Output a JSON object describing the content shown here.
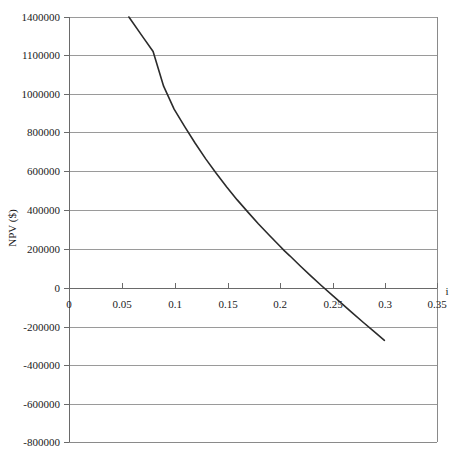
{
  "chart_data": {
    "type": "line",
    "title": "",
    "subtitle": "",
    "xlabel": "i",
    "ylabel": "NPV ($)",
    "grid": true,
    "legend": false,
    "legend_position": "none",
    "xlim": [
      0,
      0.35
    ],
    "ylim": [
      -800000,
      1400000
    ],
    "x_tick_labels": [
      "0",
      "0.05",
      "0.1",
      "0.15",
      "0.2",
      "0.25",
      "0.3",
      "0.35"
    ],
    "x_tick_values": [
      0,
      0.05,
      0.1,
      0.15,
      0.2,
      0.25,
      0.3,
      0.35
    ],
    "y_tick_labels": [
      "1400000",
      "1100000",
      "1000000",
      "800000",
      "600000",
      "400000",
      "200000",
      "0",
      "-200000",
      "-400000",
      "-600000",
      "-800000"
    ],
    "y_tick_values": [
      1400000,
      1100000,
      1000000,
      800000,
      600000,
      400000,
      200000,
      0,
      -200000,
      -400000,
      -600000,
      -800000
    ],
    "series": [
      {
        "name": "NPV",
        "x": [
          0.057,
          0.07,
          0.08,
          0.09,
          0.1,
          0.11,
          0.12,
          0.13,
          0.14,
          0.15,
          0.16,
          0.17,
          0.18,
          0.19,
          0.2,
          0.205,
          0.21,
          0.22,
          0.23,
          0.24,
          0.25,
          0.26,
          0.27,
          0.28,
          0.29,
          0.3
        ],
        "y": [
          1400000,
          1245000,
          1128000,
          1020000,
          920000,
          828000,
          742000,
          662000,
          588000,
          518000,
          452000,
          390000,
          330000,
          273000,
          218000,
          190000,
          165000,
          113000,
          62000,
          13000,
          -35000,
          -83000,
          -130000,
          -177000,
          -223000,
          -270000
        ],
        "annotations": {
          "root_label": "NPV = 0 near i = 0.205",
          "end_label": "curve ends at i = 0.3"
        }
      }
    ]
  },
  "axes": {
    "y_axis_title": "NPV ($)",
    "x_axis_title": "i",
    "origin_label": "0"
  }
}
